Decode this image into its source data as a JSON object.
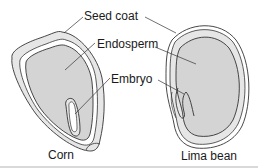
{
  "diagram": {
    "labels": {
      "seed_coat": "Seed coat",
      "endosperm": "Endosperm",
      "embryo": "Embryo"
    },
    "captions": {
      "corn": "Corn",
      "lima_bean": "Lima bean"
    },
    "colors": {
      "endosperm_fill": "#d4d4d4",
      "seed_coat_fill": "#e6e6e6",
      "outline": "#333333",
      "text": "#1a1a1a"
    }
  }
}
